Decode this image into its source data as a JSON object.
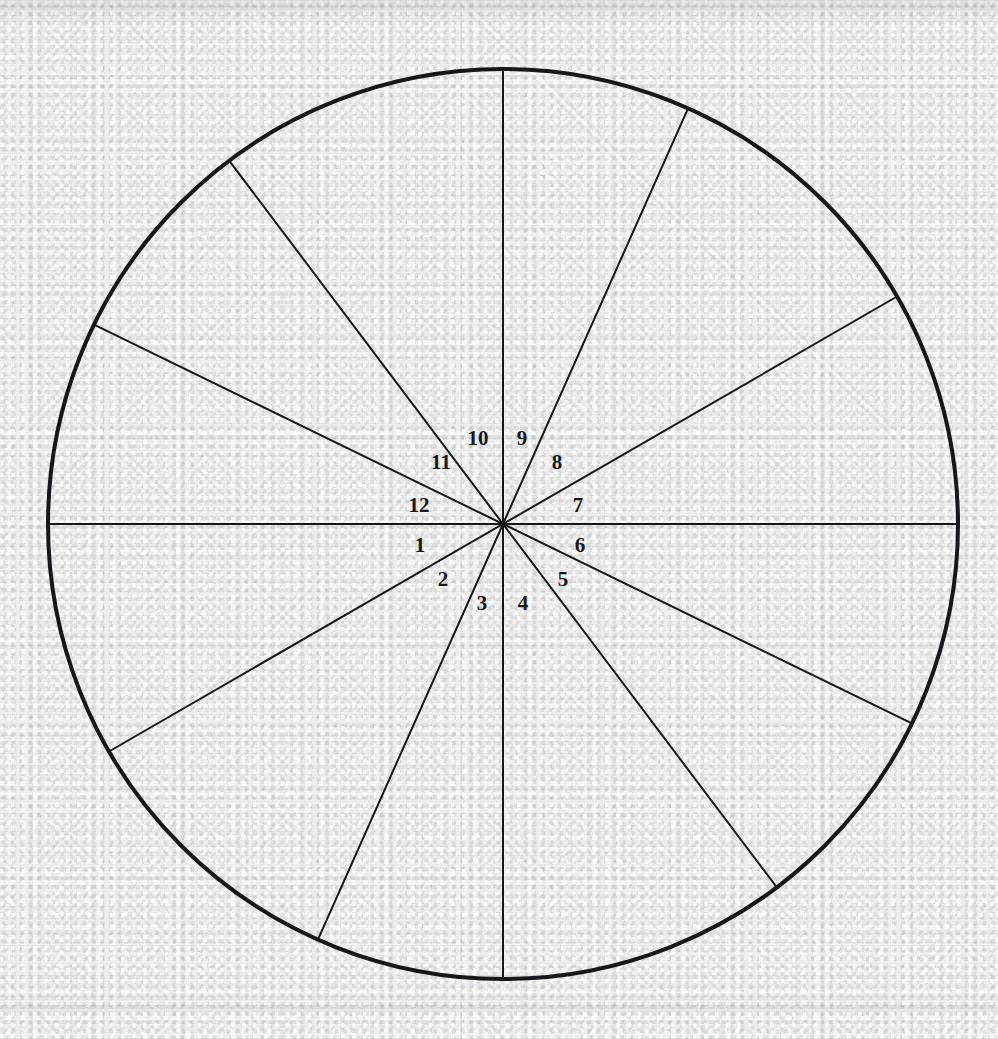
{
  "figure": {
    "paper_color": "#efefef",
    "ink_color": "#15171a",
    "circle": {
      "center_x": 503,
      "center_y": 524,
      "radius": 455,
      "outline_width": 4
    },
    "radius_line_width": 2,
    "diameters": [
      {
        "name": "horizontal-diameter",
        "angle_deg": 0
      },
      {
        "name": "diameter-30-210",
        "angle_deg": 30
      },
      {
        "name": "diameter-66-246",
        "angle_deg": 66
      },
      {
        "name": "vertical-diameter",
        "angle_deg": 90
      },
      {
        "name": "diameter-127-307",
        "angle_deg": 127
      },
      {
        "name": "diameter-154-334",
        "angle_deg": 154
      }
    ],
    "sector_count": 12,
    "sectors": [
      {
        "number": "1",
        "label": "1",
        "start_deg": 180,
        "end_deg": 206,
        "label_x": 420,
        "label_y": 545
      },
      {
        "number": "2",
        "label": "2",
        "start_deg": 206,
        "end_deg": 232,
        "label_x": 443,
        "label_y": 579
      },
      {
        "number": "3",
        "label": "3",
        "start_deg": 232,
        "end_deg": 270,
        "label_x": 482,
        "label_y": 603
      },
      {
        "number": "4",
        "label": "4",
        "start_deg": 270,
        "end_deg": 296,
        "label_x": 523,
        "label_y": 603
      },
      {
        "number": "5",
        "label": "5",
        "start_deg": 296,
        "end_deg": 330,
        "label_x": 563,
        "label_y": 579
      },
      {
        "number": "6",
        "label": "6",
        "start_deg": 330,
        "end_deg": 360,
        "label_x": 580,
        "label_y": 545
      },
      {
        "number": "7",
        "label": "7",
        "start_deg": 0,
        "end_deg": 30,
        "label_x": 578,
        "label_y": 505
      },
      {
        "number": "8",
        "label": "8",
        "start_deg": 30,
        "end_deg": 66,
        "label_x": 557,
        "label_y": 462
      },
      {
        "number": "9",
        "label": "9",
        "start_deg": 66,
        "end_deg": 90,
        "label_x": 522,
        "label_y": 438
      },
      {
        "number": "10",
        "label": "10",
        "start_deg": 90,
        "end_deg": 127,
        "label_x": 478,
        "label_y": 438
      },
      {
        "number": "11",
        "label": "11",
        "start_deg": 127,
        "end_deg": 154,
        "label_x": 441,
        "label_y": 462
      },
      {
        "number": "12",
        "label": "12",
        "start_deg": 154,
        "end_deg": 180,
        "label_x": 419,
        "label_y": 505
      }
    ]
  }
}
